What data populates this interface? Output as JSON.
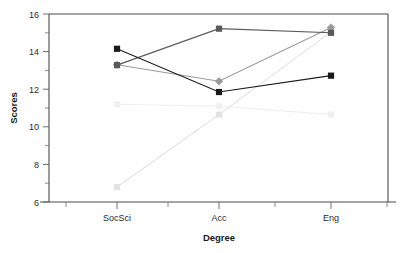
{
  "chart_data": {
    "type": "line",
    "title": "",
    "xlabel": "Degree",
    "ylabel": "Scores",
    "categories": [
      "SocSci",
      "Acc",
      "Eng"
    ],
    "ylim": [
      6,
      16
    ],
    "ytick_labels": [
      "6",
      "8",
      "10",
      "12",
      "14",
      "16"
    ],
    "ytick_values": [
      6,
      8,
      10,
      12,
      14,
      16
    ],
    "yminor_values": [
      7,
      9,
      11,
      13,
      15
    ],
    "grid": false,
    "legend": "none",
    "series": [
      {
        "name": "series-dark-square",
        "color": "#1a1a1a",
        "marker": "square",
        "values": [
          14.15,
          11.85,
          12.72
        ]
      },
      {
        "name": "series-darkgray-square",
        "color": "#5a5a5a",
        "marker": "square",
        "values": [
          13.28,
          15.22,
          15.0
        ]
      },
      {
        "name": "series-gray-diamond",
        "color": "#9a9a9a",
        "marker": "diamond",
        "values": [
          13.3,
          12.42,
          15.28
        ]
      },
      {
        "name": "series-light-rising",
        "color": "#e2e2e2",
        "marker": "square",
        "values": [
          6.8,
          10.65,
          15.05
        ]
      },
      {
        "name": "series-faint-flat",
        "color": "#f0f0f0",
        "marker": "square",
        "values": [
          11.2,
          11.1,
          10.65
        ]
      }
    ]
  },
  "axis": {
    "frame_color": "#4a4a4a",
    "tick_color": "#6e6e6e"
  }
}
